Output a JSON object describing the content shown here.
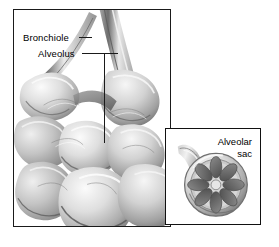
{
  "figure": {
    "type": "anatomical-illustration",
    "style": "grayscale pencil shading",
    "background_color": "#ffffff",
    "frame_color": "#1a1a1a",
    "text_color": "#000000"
  },
  "main_panel": {
    "name": "bronchiole-and-alveoli-cluster",
    "labels": [
      {
        "text": "Bronchiole",
        "leader": "short-dash-right"
      },
      {
        "text": "Alveolus",
        "leader": "elbow-right-then-down"
      }
    ]
  },
  "inset_panel": {
    "name": "alveolar-sac-cross-section",
    "label_line_1": "Alveolar",
    "label_line_2": "sac",
    "petal_count": 8
  }
}
